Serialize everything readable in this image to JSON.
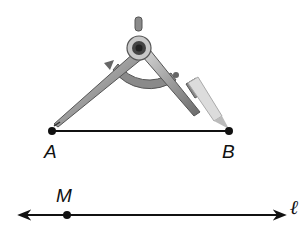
{
  "diagram": {
    "segment": {
      "start_label": "A",
      "end_label": "B"
    },
    "line": {
      "label": "ℓ",
      "point_label": "M"
    },
    "colors": {
      "ink": "#111111",
      "compass_metal": "#9a9a9a",
      "compass_dark": "#555555",
      "pencil": "#dcdcdc"
    }
  }
}
